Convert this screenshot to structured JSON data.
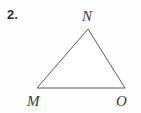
{
  "figure": {
    "problem_number": "2.",
    "shape_name": "triangle",
    "stroke_color": "#585858",
    "background_color": "#fefefe",
    "label_color": "#3a3a3a",
    "number_color": "#2b2b2b",
    "vertices": [
      {
        "id": "N",
        "label": "N",
        "x": 88,
        "y": 29,
        "position": "apex-top"
      },
      {
        "id": "M",
        "label": "M",
        "x": 37,
        "y": 88,
        "position": "bottom-left"
      },
      {
        "id": "O",
        "label": "O",
        "x": 125,
        "y": 88,
        "position": "bottom-right"
      }
    ],
    "edges": [
      {
        "from": "M",
        "to": "N"
      },
      {
        "from": "N",
        "to": "O"
      },
      {
        "from": "O",
        "to": "M"
      }
    ]
  }
}
